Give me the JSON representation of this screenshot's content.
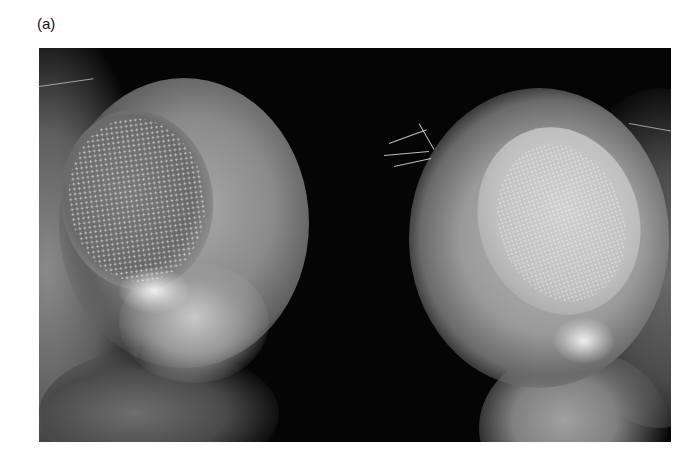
{
  "figure": {
    "panel_label": "(a)",
    "image": {
      "subject": "two-fly-heads-compound-eyes",
      "style": "grayscale-micrograph",
      "background_color": "#050505"
    }
  }
}
